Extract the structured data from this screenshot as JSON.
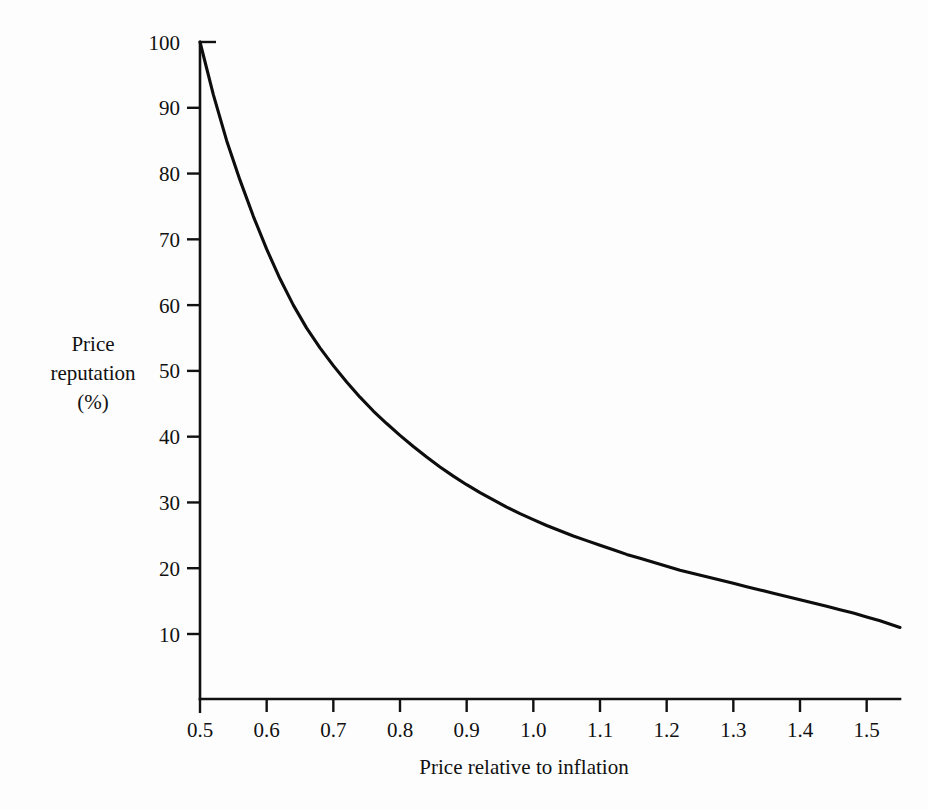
{
  "chart_data": {
    "type": "line",
    "title": "",
    "subtitle": "",
    "xlabel": "Price relative to inflation",
    "ylabel": "Price reputation (%)",
    "ylabel_lines": [
      "Price",
      "reputation",
      "(%)"
    ],
    "xlim": [
      0.5,
      1.55
    ],
    "ylim": [
      0,
      100
    ],
    "xticks": [
      0.5,
      0.6,
      0.7,
      0.8,
      0.9,
      1.0,
      1.1,
      1.2,
      1.3,
      1.4,
      1.5
    ],
    "xtick_labels": [
      "0.5",
      "0.6",
      "0.7",
      "0.8",
      "0.9",
      "1.0",
      "1.1",
      "1.2",
      "1.3",
      "1.4",
      "1.5"
    ],
    "yticks": [
      10,
      20,
      30,
      40,
      50,
      60,
      70,
      80,
      90,
      100
    ],
    "ytick_labels": [
      "10",
      "20",
      "30",
      "40",
      "50",
      "60",
      "70",
      "80",
      "90",
      "100"
    ],
    "grid": false,
    "legend": null,
    "legend_position": "none",
    "line_color": "#0d0d0d",
    "background_color": "#fdfdfd",
    "axis_color": "#111111",
    "series": [
      {
        "name": "Price reputation",
        "x": [
          0.5,
          0.52,
          0.54,
          0.56,
          0.58,
          0.6,
          0.62,
          0.64,
          0.66,
          0.68,
          0.7,
          0.72,
          0.74,
          0.76,
          0.78,
          0.8,
          0.82,
          0.84,
          0.86,
          0.88,
          0.9,
          0.92,
          0.94,
          0.96,
          0.98,
          1.0,
          1.02,
          1.04,
          1.06,
          1.08,
          1.1,
          1.12,
          1.14,
          1.16,
          1.18,
          1.2,
          1.22,
          1.24,
          1.26,
          1.28,
          1.3,
          1.32,
          1.34,
          1.36,
          1.38,
          1.4,
          1.42,
          1.44,
          1.46,
          1.48,
          1.5,
          1.52,
          1.55
        ],
        "y": [
          100.0,
          92.0,
          85.0,
          79.0,
          73.5,
          68.5,
          64.0,
          60.0,
          56.5,
          53.5,
          50.8,
          48.3,
          46.0,
          43.9,
          42.0,
          40.2,
          38.5,
          36.9,
          35.4,
          34.0,
          32.7,
          31.5,
          30.4,
          29.3,
          28.3,
          27.4,
          26.5,
          25.7,
          24.9,
          24.2,
          23.5,
          22.8,
          22.1,
          21.5,
          20.9,
          20.3,
          19.7,
          19.2,
          18.7,
          18.2,
          17.7,
          17.2,
          16.7,
          16.2,
          15.7,
          15.2,
          14.7,
          14.2,
          13.7,
          13.2,
          12.6,
          12.0,
          11.0
        ]
      }
    ],
    "key_points": [
      {
        "x": 0.5,
        "y": 100
      },
      {
        "x": 0.6,
        "y": 68.5
      },
      {
        "x": 0.7,
        "y": 50.8
      },
      {
        "x": 0.8,
        "y": 40.2
      },
      {
        "x": 0.9,
        "y": 32.7
      },
      {
        "x": 1.0,
        "y": 27.4
      },
      {
        "x": 1.1,
        "y": 23.5
      },
      {
        "x": 1.2,
        "y": 20.3
      },
      {
        "x": 1.3,
        "y": 17.7
      },
      {
        "x": 1.4,
        "y": 15.2
      },
      {
        "x": 1.5,
        "y": 12.6
      },
      {
        "x": 1.55,
        "y": 11.0
      }
    ]
  }
}
